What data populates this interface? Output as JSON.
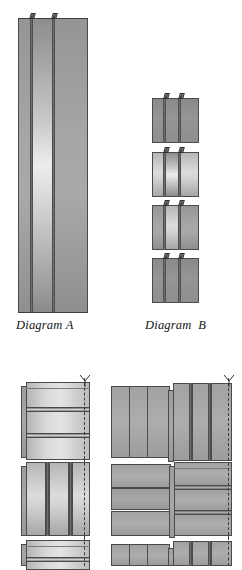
{
  "figure": {
    "type": "technical-diagram",
    "background_color": "#ffffff",
    "line_color": "#4a4a4a",
    "fill_light": "#ededed",
    "fill_mid": "#a8a8a8",
    "fill_dark": "#8a8a8a",
    "width_px": 242,
    "height_px": 566
  },
  "captions": {
    "diagram_a": "Diagram A",
    "diagram_b": "Diagram  B"
  },
  "diagram_a": {
    "label": "Diagram A",
    "panel_count": 3,
    "tab_count": 2,
    "x": 18,
    "y": 18,
    "width": 70,
    "height": 295,
    "dividers_x": [
      30,
      52
    ]
  },
  "diagram_b": {
    "label": "Diagram  B",
    "block_count": 4,
    "panel_count_per_block": 3,
    "tab_count_per_block": 2,
    "x": 152,
    "width": 47,
    "blocks": [
      {
        "y": 98,
        "height": 45,
        "shade": "dark"
      },
      {
        "y": 152,
        "height": 45,
        "shade": "light"
      },
      {
        "y": 205,
        "height": 45,
        "shade": "mid"
      },
      {
        "y": 258,
        "height": 45,
        "shade": "dark"
      }
    ]
  },
  "assemblies": {
    "left_column": [
      {
        "name": "unit-horizontal-split",
        "y": 382,
        "height": 78,
        "split": "horizontal",
        "bands": 3
      },
      {
        "name": "unit-vertical-split",
        "y": 462,
        "height": 76,
        "split": "vertical",
        "bands": 3
      },
      {
        "name": "unit-horizontal-split-clipped",
        "y": 540,
        "height": 26,
        "split": "horizontal",
        "bands": 2
      }
    ],
    "right_column": [
      {
        "name": "pair-vertical-vertical",
        "y": 382,
        "height": 78,
        "left_split": "vertical",
        "right_split": "vertical"
      },
      {
        "name": "pair-horizontal-horizontal",
        "y": 462,
        "height": 76,
        "left_split": "horizontal",
        "right_split": "horizontal"
      },
      {
        "name": "pair-vertical-vertical-clipped",
        "y": 540,
        "height": 26,
        "left_split": "vertical",
        "right_split": "vertical"
      }
    ],
    "hinge_line_style": "dashed",
    "marker": "y-arrow-mark"
  }
}
